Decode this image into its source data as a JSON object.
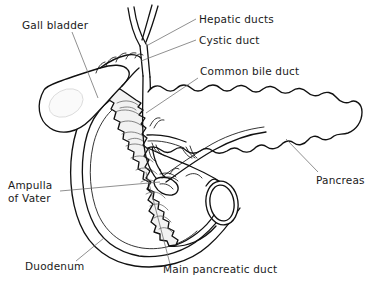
{
  "figure": {
    "background_color": "#ffffff",
    "ink_color": "#111111",
    "leader_color": "#6b6b6b",
    "shade_color": "#f2f2f2",
    "width": 367,
    "height": 285
  },
  "labels": {
    "gall_bladder": "Gall bladder",
    "hepatic_ducts": "Hepatic ducts",
    "cystic_duct": "Cystic duct",
    "common_bile_duct": "Common bile duct",
    "pancreas": "Pancreas",
    "ampulla_line1": "Ampulla",
    "ampulla_line2": "of  Vater",
    "duodenum": "Duodenum",
    "main_pancreatic_duct": "Main pancreatic duct"
  },
  "structures": [
    {
      "name": "gall-bladder",
      "label": "Gall bladder",
      "kind": "organ"
    },
    {
      "name": "hepatic-ducts",
      "label": "Hepatic ducts",
      "kind": "duct"
    },
    {
      "name": "cystic-duct",
      "label": "Cystic duct",
      "kind": "duct"
    },
    {
      "name": "common-bile-duct",
      "label": "Common bile duct",
      "kind": "duct"
    },
    {
      "name": "pancreas",
      "label": "Pancreas",
      "kind": "organ"
    },
    {
      "name": "ampulla-of-vater",
      "label": "Ampulla of Vater",
      "kind": "structure"
    },
    {
      "name": "duodenum",
      "label": "Duodenum",
      "kind": "organ"
    },
    {
      "name": "main-pancreatic-duct",
      "label": "Main pancreatic duct",
      "kind": "duct"
    }
  ]
}
